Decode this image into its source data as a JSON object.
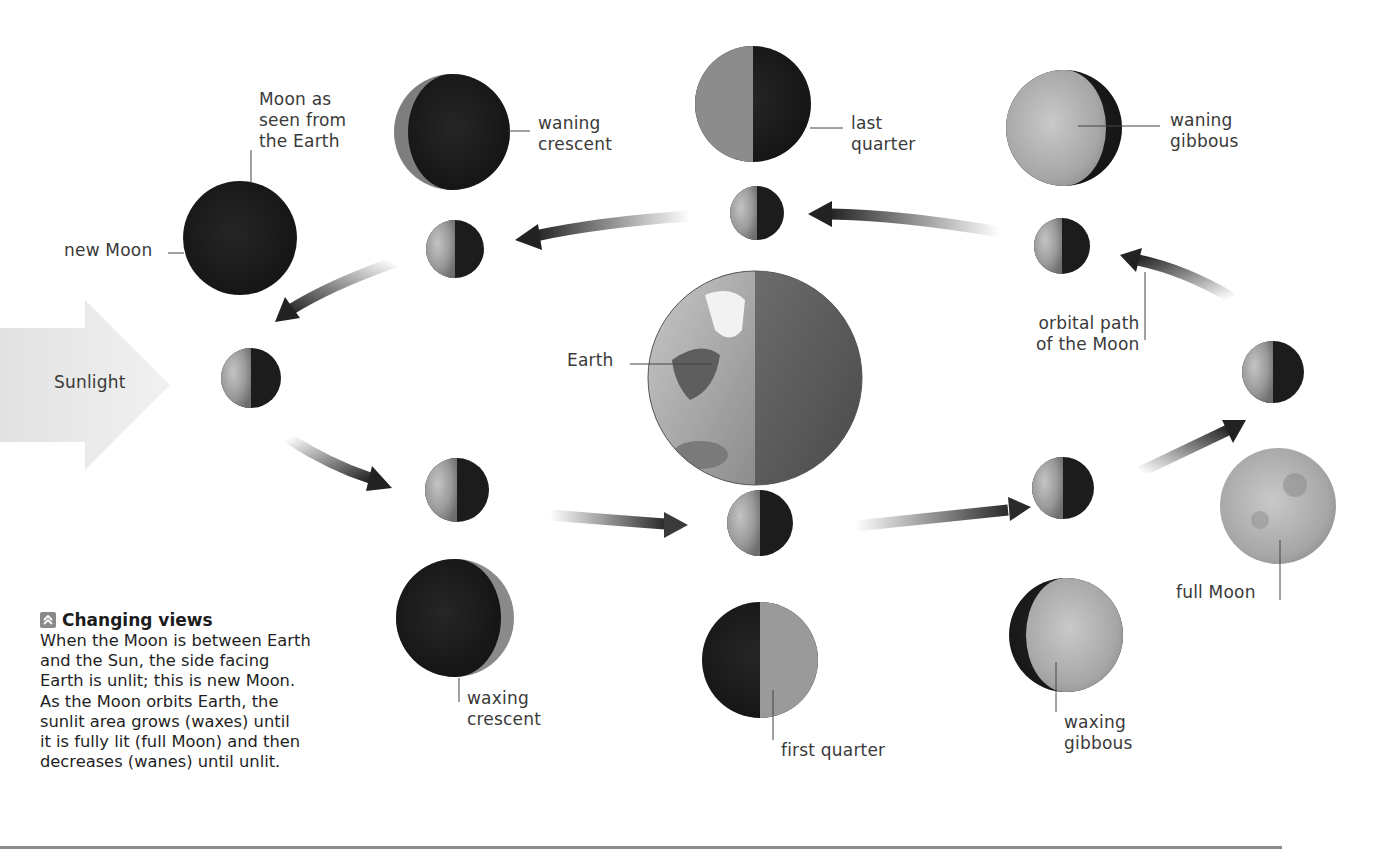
{
  "diagram": {
    "type": "moon-phases-orbit",
    "sunlight_label": "Sunlight",
    "earth_label": "Earth",
    "orbit_label": "orbital path\nof the Moon",
    "seen_from_earth_label": "Moon as\nseen from\nthe Earth",
    "phases": [
      {
        "id": "new-moon",
        "label": "new Moon",
        "lit_fraction": 0.0
      },
      {
        "id": "waxing-crescent",
        "label": "waxing\ncrescent",
        "lit_fraction": 0.15
      },
      {
        "id": "first-quarter",
        "label": "first quarter",
        "lit_fraction": 0.5
      },
      {
        "id": "waxing-gibbous",
        "label": "waxing\ngibbous",
        "lit_fraction": 0.85
      },
      {
        "id": "full-moon",
        "label": "full Moon",
        "lit_fraction": 1.0
      },
      {
        "id": "waning-gibbous",
        "label": "waning\ngibbous",
        "lit_fraction": 0.85
      },
      {
        "id": "last-quarter",
        "label": "last\nquarter",
        "lit_fraction": 0.5
      },
      {
        "id": "waning-crescent",
        "label": "waning\ncrescent",
        "lit_fraction": 0.15
      }
    ],
    "colors": {
      "moon_dark": "#1b1b1b",
      "moon_lit": "#9c9c9c",
      "earth_lit": "#a8a8a8",
      "earth_dark": "#5a5a5a",
      "arrow": "#2a2a2a",
      "sunlight": "#ececec",
      "rule": "#8c8c8c"
    }
  },
  "caption": {
    "title": "Changing views",
    "body": "When the Moon is between Earth\nand the Sun, the side facing\nEarth is unlit; this is new Moon.\nAs the Moon orbits Earth, the\nsunlit area grows (waxes) until\nit is fully lit (full Moon) and then\ndecreases (wanes) until unlit."
  }
}
